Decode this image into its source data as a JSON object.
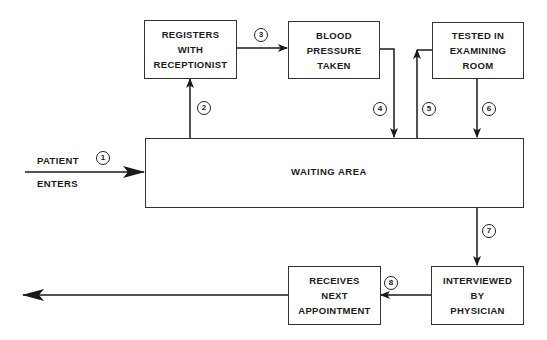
{
  "diagram": {
    "type": "flowchart",
    "entry": {
      "line1": "PATIENT",
      "line2": "ENTERS"
    },
    "nodes": {
      "registers": {
        "lines": [
          "REGISTERS",
          "WITH",
          "RECEPTIONIST"
        ]
      },
      "blood_pressure": {
        "lines": [
          "BLOOD",
          "PRESSURE",
          "TAKEN"
        ]
      },
      "tested": {
        "lines": [
          "TESTED IN",
          "EXAMINING",
          "ROOM"
        ]
      },
      "waiting": {
        "label": "WAITING AREA"
      },
      "interviewed": {
        "lines": [
          "INTERVIEWED",
          "BY",
          "PHYSICIAN"
        ]
      },
      "receives": {
        "lines": [
          "RECEIVES",
          "NEXT",
          "APPOINTMENT"
        ]
      }
    },
    "steps": [
      "1",
      "2",
      "3",
      "4",
      "5",
      "6",
      "7",
      "8"
    ],
    "edges": [
      {
        "step": "1",
        "from": "entry",
        "to": "waiting"
      },
      {
        "step": "2",
        "from": "waiting",
        "to": "registers"
      },
      {
        "step": "3",
        "from": "registers",
        "to": "blood_pressure"
      },
      {
        "step": "4",
        "from": "blood_pressure",
        "to": "waiting"
      },
      {
        "step": "5",
        "from": "waiting",
        "to": "tested"
      },
      {
        "step": "6",
        "from": "tested",
        "to": "waiting"
      },
      {
        "step": "7",
        "from": "waiting",
        "to": "interviewed"
      },
      {
        "step": "8",
        "from": "interviewed",
        "to": "receives"
      },
      {
        "step": "",
        "from": "receives",
        "to": "exit"
      }
    ],
    "colors": {
      "line": "#1a1a1a",
      "background": "#ffffff"
    }
  }
}
